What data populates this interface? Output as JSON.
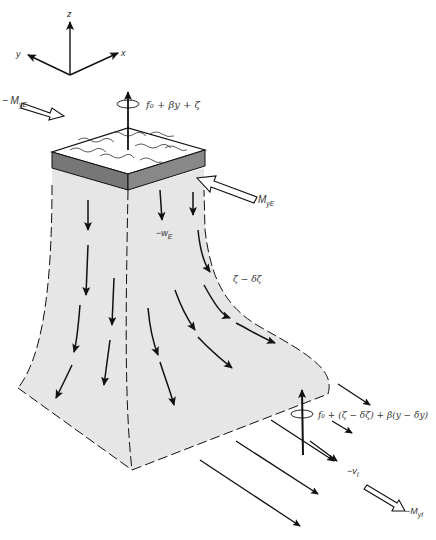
{
  "diagram": {
    "type": "ekman-column-schematic",
    "axes": {
      "x": "x",
      "y": "y",
      "z": "z"
    },
    "labels": {
      "surface_rotation": "f₀ + βy + ζ",
      "transport_left": "− M",
      "transport_left_sub": "yE",
      "transport_right": "M",
      "transport_right_sub": "yE",
      "ekman_pumping": "−w",
      "ekman_pumping_sub": "E",
      "column_vorticity": "ζ − δζ",
      "interior_rotation": "f₀ + (ζ − δζ) + β(y − δy)",
      "interior_velocity": "−v",
      "interior_velocity_sub": "I",
      "interior_transport": "−M",
      "interior_transport_sub": "yI"
    },
    "colors": {
      "column_fill": "#e6e6e6",
      "slab_side": "#7a7a7a",
      "slab_top": "#ffffff",
      "line": "#111111"
    }
  }
}
